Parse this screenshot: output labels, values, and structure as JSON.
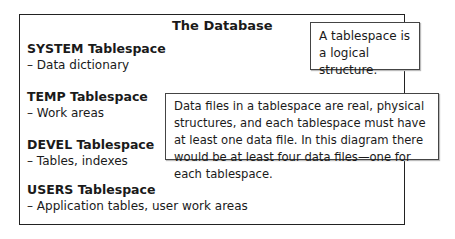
{
  "database": {
    "title": "The Database",
    "tablespaces": [
      {
        "name": "SYSTEM Tablespace",
        "desc": "– Data dictionary"
      },
      {
        "name": "TEMP Tablespace",
        "desc": "– Work areas"
      },
      {
        "name": "DEVEL Tablespace",
        "desc": "– Tables, indexes"
      },
      {
        "name": "USERS Tablespace",
        "desc": "– Application tables, user work areas"
      }
    ]
  },
  "callouts": {
    "logical": "A tablespace is a logical structure.",
    "physical": "Data files in a tablespace are real, physical structures, and each tablespace must have at least one data file. In this diagram there would be at least four data files—one for each tablespace."
  }
}
